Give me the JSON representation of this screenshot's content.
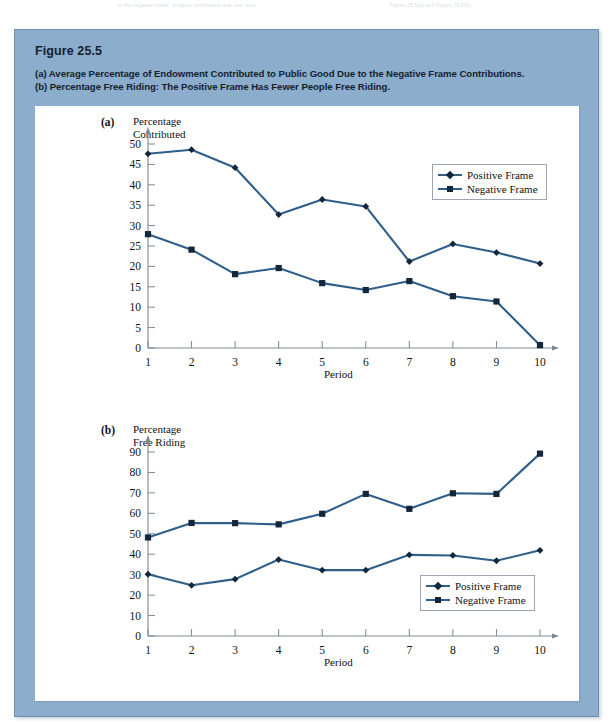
{
  "page": {
    "ghost_text_left": "in the negative frame, subjects contributed less over time",
    "ghost_text_right": "Figure 25.5(a) and Figure 25.5(b)."
  },
  "figure": {
    "number_label": "Figure 25.5",
    "caption_a": "(a) Average Percentage of Endowment Contributed to Public Good Due to the Negative Frame Contributions.",
    "caption_b": "(b) Percentage Free Riding: The Positive Frame Has Fewer People Free Riding.",
    "frame_color": "#8cadcc",
    "frame_border_color": "#6d90b2",
    "panel_background": "#ffffff"
  },
  "style": {
    "line_color": "#2e5f8a",
    "marker_color": "#14263a",
    "axis_color": "#7a8794",
    "text_color": "#111111"
  },
  "chart_data": [
    {
      "type": "line",
      "panel_letter": "(a)",
      "title": "Percentage\nContributed",
      "ylabel": "Percentage Contributed",
      "xlabel": "Period",
      "x": [
        1,
        2,
        3,
        4,
        5,
        6,
        7,
        8,
        9,
        10
      ],
      "categories": [
        "1",
        "2",
        "3",
        "4",
        "5",
        "6",
        "7",
        "8",
        "9",
        "10"
      ],
      "xlim": [
        1,
        10
      ],
      "ylim": [
        0,
        50
      ],
      "yticks": [
        0,
        5,
        10,
        15,
        20,
        25,
        30,
        35,
        40,
        45,
        50
      ],
      "ytick_labels": [
        "0",
        "5",
        "10",
        "15",
        "20",
        "25",
        "30",
        "35",
        "40",
        "45",
        "50"
      ],
      "grid": false,
      "legend_position": "upper-right",
      "series": [
        {
          "name": "Positive Frame",
          "marker": "diamond",
          "values": [
            47.6,
            48.6,
            44.2,
            32.7,
            36.4,
            34.7,
            21.2,
            25.5,
            23.4,
            20.7
          ]
        },
        {
          "name": "Negative Frame",
          "marker": "square",
          "values": [
            27.9,
            24.1,
            18.1,
            19.6,
            15.9,
            14.2,
            16.4,
            12.7,
            11.4,
            0.7
          ]
        }
      ]
    },
    {
      "type": "line",
      "panel_letter": "(b)",
      "title": "Percentage\nFree Riding",
      "ylabel": "Percentage Free Riding",
      "xlabel": "Period",
      "x": [
        1,
        2,
        3,
        4,
        5,
        6,
        7,
        8,
        9,
        10
      ],
      "categories": [
        "1",
        "2",
        "3",
        "4",
        "5",
        "6",
        "7",
        "8",
        "9",
        "10"
      ],
      "xlim": [
        1,
        10
      ],
      "ylim": [
        0,
        90
      ],
      "yticks": [
        0,
        10,
        20,
        30,
        40,
        50,
        60,
        70,
        80,
        90
      ],
      "ytick_labels": [
        "0",
        "10",
        "20",
        "30",
        "40",
        "50",
        "60",
        "70",
        "80",
        "90"
      ],
      "grid": false,
      "legend_position": "lower-right",
      "series": [
        {
          "name": "Positive Frame",
          "marker": "diamond",
          "values": [
            30.2,
            24.8,
            27.8,
            37.4,
            32.2,
            32.2,
            39.7,
            39.4,
            36.8,
            41.9
          ]
        },
        {
          "name": "Negative Frame",
          "marker": "square",
          "values": [
            48.2,
            55.3,
            55.2,
            54.6,
            59.8,
            69.5,
            62.2,
            69.8,
            69.5,
            89.2
          ]
        }
      ]
    }
  ]
}
